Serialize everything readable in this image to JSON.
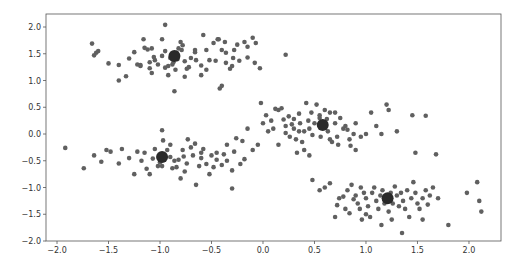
{
  "chart_data": {
    "type": "scatter",
    "title": "",
    "xlabel": "",
    "ylabel": "",
    "xlim": [
      -2.107,
      2.311
    ],
    "ylim": [
      -2.0,
      2.243
    ],
    "grid": false,
    "legend": null,
    "x_ticks": [
      -2.0,
      -1.5,
      -1.0,
      -0.5,
      0.0,
      0.5,
      1.0,
      1.5,
      2.0
    ],
    "x_tick_labels": [
      "−2.0",
      "−1.5",
      "−1.0",
      "−0.5",
      "0.0",
      "0.5",
      "1.0",
      "1.5",
      "2.0"
    ],
    "y_ticks": [
      -2.0,
      -1.5,
      -1.0,
      -0.5,
      0.0,
      0.5,
      1.0,
      1.5,
      2.0
    ],
    "y_tick_labels": [
      "−2.0",
      "−1.5",
      "−1.0",
      "−0.5",
      "0.0",
      "0.5",
      "1.0",
      "1.5",
      "2.0"
    ],
    "point_color": "#606060",
    "centroid_color": "#2a2a2a",
    "centroids": [
      {
        "x": -0.86,
        "y": 1.46
      },
      {
        "x": -0.98,
        "y": -0.43
      },
      {
        "x": 0.58,
        "y": 0.17
      },
      {
        "x": 1.21,
        "y": -1.2
      }
    ],
    "series": [
      {
        "name": "cluster-1",
        "points": [
          [
            -1.66,
            1.69
          ],
          [
            -1.62,
            1.52
          ],
          [
            -1.64,
            1.47
          ],
          [
            -1.6,
            1.55
          ],
          [
            -1.4,
            1.29
          ],
          [
            -1.5,
            1.32
          ],
          [
            -1.33,
            1.08
          ],
          [
            -1.4,
            1.0
          ],
          [
            -1.3,
            1.41
          ],
          [
            -1.25,
            1.53
          ],
          [
            -1.22,
            1.3
          ],
          [
            -1.19,
            1.27
          ],
          [
            -1.19,
            1.29
          ],
          [
            -1.16,
            1.77
          ],
          [
            -1.15,
            1.61
          ],
          [
            -1.1,
            1.34
          ],
          [
            -1.1,
            1.23
          ],
          [
            -1.08,
            1.14
          ],
          [
            -1.06,
            1.44
          ],
          [
            -1.05,
            1.38
          ],
          [
            -1.02,
            1.3
          ],
          [
            -0.98,
            1.77
          ],
          [
            -0.98,
            1.46
          ],
          [
            -0.95,
            2.04
          ],
          [
            -0.95,
            1.24
          ],
          [
            -0.92,
            1.27
          ],
          [
            -0.92,
            1.1
          ],
          [
            -0.9,
            1.42
          ],
          [
            -0.87,
            1.34
          ],
          [
            -0.85,
            1.2
          ],
          [
            -0.84,
            1.52
          ],
          [
            -0.83,
            1.4
          ],
          [
            -0.82,
            1.6
          ],
          [
            -0.8,
            1.72
          ],
          [
            -0.79,
            1.57
          ],
          [
            -0.78,
            1.66
          ],
          [
            -0.76,
            1.07
          ],
          [
            -0.76,
            1.36
          ],
          [
            -0.74,
            1.22
          ],
          [
            -0.7,
            1.42
          ],
          [
            -0.66,
            1.57
          ],
          [
            -0.66,
            1.53
          ],
          [
            -0.65,
            1.38
          ],
          [
            -0.6,
            1.1
          ],
          [
            -0.6,
            1.28
          ],
          [
            -0.58,
            1.85
          ],
          [
            -0.55,
            1.57
          ],
          [
            -0.52,
            1.38
          ],
          [
            -0.48,
            1.7
          ],
          [
            -0.46,
            1.37
          ],
          [
            -0.44,
            1.77
          ],
          [
            -0.43,
            1.77
          ],
          [
            -0.4,
            1.57
          ],
          [
            -0.37,
            1.72
          ],
          [
            -0.36,
            1.33
          ],
          [
            -0.36,
            1.52
          ],
          [
            -0.32,
            1.22
          ],
          [
            -0.3,
            1.27
          ],
          [
            -0.29,
            1.42
          ],
          [
            -0.28,
            1.57
          ],
          [
            -0.25,
            1.67
          ],
          [
            -0.23,
            1.37
          ],
          [
            -0.18,
            1.72
          ],
          [
            -0.15,
            1.43
          ],
          [
            -0.15,
            1.63
          ],
          [
            -0.08,
            1.33
          ],
          [
            -0.07,
            1.7
          ],
          [
            -0.03,
            1.23
          ],
          [
            0.22,
            1.48
          ],
          [
            -0.86,
            0.8
          ],
          [
            -0.42,
            0.85
          ],
          [
            -0.4,
            0.9
          ],
          [
            -1.12,
            1.58
          ],
          [
            -1.08,
            1.6
          ],
          [
            -0.95,
            1.55
          ],
          [
            -0.88,
            1.3
          ],
          [
            -0.72,
            1.25
          ],
          [
            -0.55,
            1.2
          ],
          [
            -0.1,
            1.8
          ]
        ]
      },
      {
        "name": "cluster-2",
        "points": [
          [
            -1.92,
            -0.26
          ],
          [
            -1.74,
            -0.64
          ],
          [
            -1.64,
            -0.4
          ],
          [
            -1.57,
            -0.52
          ],
          [
            -1.52,
            -0.3
          ],
          [
            -1.48,
            -0.33
          ],
          [
            -1.37,
            -0.28
          ],
          [
            -1.22,
            -0.33
          ],
          [
            -1.15,
            -0.35
          ],
          [
            -1.13,
            -0.65
          ],
          [
            -1.1,
            -0.75
          ],
          [
            -1.07,
            -0.46
          ],
          [
            -1.05,
            -0.28
          ],
          [
            -1.02,
            -0.6
          ],
          [
            -1.0,
            -0.53
          ],
          [
            -0.98,
            -0.6
          ],
          [
            -0.97,
            -0.12
          ],
          [
            -0.95,
            -0.43
          ],
          [
            -0.93,
            -0.3
          ],
          [
            -0.9,
            -0.43
          ],
          [
            -0.88,
            -0.64
          ],
          [
            -0.86,
            -0.5
          ],
          [
            -0.84,
            -0.62
          ],
          [
            -0.82,
            -0.48
          ],
          [
            -0.8,
            -0.83
          ],
          [
            -0.78,
            -0.3
          ],
          [
            -0.77,
            -0.42
          ],
          [
            -0.76,
            -0.7
          ],
          [
            -0.74,
            -0.55
          ],
          [
            -0.7,
            -0.25
          ],
          [
            -0.68,
            -0.4
          ],
          [
            -0.66,
            -0.18
          ],
          [
            -0.62,
            -0.6
          ],
          [
            -0.6,
            -0.45
          ],
          [
            -0.58,
            -0.28
          ],
          [
            -0.55,
            -0.56
          ],
          [
            -0.52,
            -0.75
          ],
          [
            -0.5,
            -0.4
          ],
          [
            -0.48,
            -0.62
          ],
          [
            -0.45,
            -0.35
          ],
          [
            -0.4,
            -0.58
          ],
          [
            -0.38,
            -0.38
          ],
          [
            -0.35,
            -0.5
          ],
          [
            -0.3,
            -0.68
          ],
          [
            -0.28,
            -0.33
          ],
          [
            -0.26,
            -0.08
          ],
          [
            -0.22,
            -0.56
          ],
          [
            -0.2,
            -0.13
          ],
          [
            -0.18,
            -0.47
          ],
          [
            -0.15,
            0.1
          ],
          [
            -0.1,
            -0.3
          ],
          [
            -0.05,
            -0.2
          ],
          [
            -0.3,
            -1.02
          ],
          [
            -0.65,
            -0.95
          ],
          [
            -1.25,
            -0.75
          ],
          [
            -1.4,
            -0.55
          ],
          [
            -1.3,
            -0.45
          ],
          [
            -0.98,
            0.07
          ],
          [
            -0.9,
            -0.2
          ],
          [
            -1.18,
            -0.5
          ],
          [
            -0.73,
            -0.1
          ],
          [
            -0.6,
            -0.35
          ],
          [
            -0.45,
            -0.48
          ],
          [
            -0.35,
            -0.2
          ]
        ]
      },
      {
        "name": "cluster-3",
        "points": [
          [
            -0.02,
            0.58
          ],
          [
            0.0,
            0.2
          ],
          [
            0.03,
            0.35
          ],
          [
            0.05,
            0.05
          ],
          [
            0.08,
            0.25
          ],
          [
            0.12,
            0.47
          ],
          [
            0.15,
            0.45
          ],
          [
            0.18,
            0.48
          ],
          [
            0.2,
            0.27
          ],
          [
            0.22,
            0.15
          ],
          [
            0.22,
            0.02
          ],
          [
            0.25,
            0.33
          ],
          [
            0.26,
            -0.05
          ],
          [
            0.28,
            0.18
          ],
          [
            0.3,
            0.28
          ],
          [
            0.3,
            0.1
          ],
          [
            0.32,
            -0.1
          ],
          [
            0.33,
            -0.35
          ],
          [
            0.35,
            0.05
          ],
          [
            0.36,
            0.2
          ],
          [
            0.38,
            -0.15
          ],
          [
            0.4,
            0.05
          ],
          [
            0.4,
            -0.3
          ],
          [
            0.42,
            0.58
          ],
          [
            0.44,
            0.25
          ],
          [
            0.45,
            0.1
          ],
          [
            0.47,
            0.4
          ],
          [
            0.48,
            -0.02
          ],
          [
            0.5,
            0.2
          ],
          [
            0.52,
            0.55
          ],
          [
            0.55,
            0.3
          ],
          [
            0.56,
            -0.05
          ],
          [
            0.58,
            0.17
          ],
          [
            0.6,
            0.45
          ],
          [
            0.62,
            0.28
          ],
          [
            0.63,
            0.05
          ],
          [
            0.65,
            0.4
          ],
          [
            0.67,
            -0.15
          ],
          [
            0.7,
            0.2
          ],
          [
            0.72,
            -0.05
          ],
          [
            0.73,
            -0.2
          ],
          [
            0.75,
            0.3
          ],
          [
            0.78,
            0.1
          ],
          [
            0.8,
            0.15
          ],
          [
            0.82,
            0.08
          ],
          [
            0.84,
            -0.1
          ],
          [
            0.88,
            0.0
          ],
          [
            0.9,
            0.2
          ],
          [
            0.95,
            -0.05
          ],
          [
            1.0,
            0.0
          ],
          [
            1.05,
            0.4
          ],
          [
            1.1,
            0.15
          ],
          [
            1.15,
            0.0
          ],
          [
            1.2,
            0.55
          ],
          [
            1.22,
            0.45
          ],
          [
            1.45,
            0.35
          ],
          [
            1.48,
            -0.35
          ],
          [
            1.58,
            0.34
          ],
          [
            1.68,
            -0.38
          ],
          [
            0.35,
            0.38
          ],
          [
            0.45,
            -0.4
          ],
          [
            0.55,
            0.35
          ],
          [
            0.65,
            -0.1
          ],
          [
            0.7,
            0.4
          ],
          [
            0.85,
            -0.22
          ],
          [
            0.15,
            -0.2
          ],
          [
            0.1,
            0.1
          ],
          [
            0.9,
            -0.3
          ],
          [
            1.3,
            0.05
          ]
        ]
      },
      {
        "name": "cluster-4",
        "points": [
          [
            0.48,
            -0.86
          ],
          [
            0.55,
            -1.05
          ],
          [
            0.65,
            -0.92
          ],
          [
            0.72,
            -1.33
          ],
          [
            0.74,
            -1.2
          ],
          [
            0.78,
            -1.17
          ],
          [
            0.8,
            -1.4
          ],
          [
            0.82,
            -1.05
          ],
          [
            0.84,
            -1.48
          ],
          [
            0.86,
            -0.95
          ],
          [
            0.88,
            -1.22
          ],
          [
            0.9,
            -1.15
          ],
          [
            0.92,
            -1.3
          ],
          [
            0.94,
            -1.4
          ],
          [
            0.96,
            -1.6
          ],
          [
            0.98,
            -1.1
          ],
          [
            1.0,
            -1.2
          ],
          [
            1.02,
            -1.35
          ],
          [
            1.04,
            -1.55
          ],
          [
            1.06,
            -1.1
          ],
          [
            1.08,
            -1.0
          ],
          [
            1.1,
            -1.25
          ],
          [
            1.12,
            -1.4
          ],
          [
            1.14,
            -1.15
          ],
          [
            1.16,
            -1.05
          ],
          [
            1.18,
            -1.3
          ],
          [
            1.2,
            -1.2
          ],
          [
            1.22,
            -1.45
          ],
          [
            1.24,
            -1.1
          ],
          [
            1.26,
            -1.3
          ],
          [
            1.28,
            -0.98
          ],
          [
            1.3,
            -1.15
          ],
          [
            1.32,
            -1.35
          ],
          [
            1.34,
            -1.1
          ],
          [
            1.36,
            -1.25
          ],
          [
            1.38,
            -1.4
          ],
          [
            1.4,
            -1.05
          ],
          [
            1.42,
            -1.55
          ],
          [
            1.44,
            -1.2
          ],
          [
            1.46,
            -0.9
          ],
          [
            1.48,
            -1.1
          ],
          [
            1.5,
            -1.3
          ],
          [
            1.52,
            -1.4
          ],
          [
            1.55,
            -1.2
          ],
          [
            1.58,
            -1.05
          ],
          [
            1.6,
            -1.32
          ],
          [
            1.62,
            -1.15
          ],
          [
            1.65,
            -1.0
          ],
          [
            1.8,
            -1.7
          ],
          [
            1.35,
            -1.85
          ],
          [
            1.98,
            -1.1
          ],
          [
            2.08,
            -0.9
          ],
          [
            2.12,
            -1.45
          ],
          [
            2.1,
            -1.25
          ],
          [
            1.0,
            -1.5
          ],
          [
            0.6,
            -1.0
          ],
          [
            0.7,
            -1.55
          ],
          [
            1.15,
            -1.7
          ],
          [
            1.25,
            -1.6
          ],
          [
            1.55,
            -1.6
          ],
          [
            0.95,
            -1.0
          ],
          [
            1.7,
            -1.2
          ]
        ]
      }
    ]
  }
}
